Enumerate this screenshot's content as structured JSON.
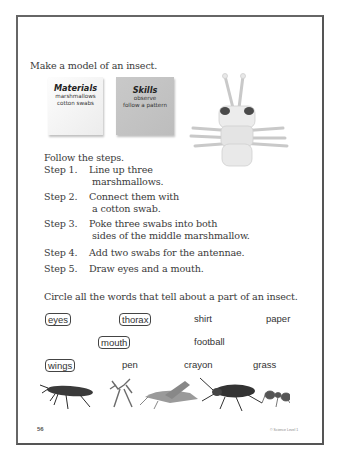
{
  "instructions": {
    "title": "Make a model of an insect.",
    "follow": "Follow the steps."
  },
  "materials_card": {
    "heading": "Materials",
    "items": [
      "marshmallows",
      "cotton swabs"
    ]
  },
  "skills_card": {
    "heading": "Skills",
    "items": [
      "observe",
      "follow a pattern"
    ]
  },
  "steps": [
    {
      "label": "Step 1.",
      "lines": [
        "Line up three",
        "marshmallows."
      ]
    },
    {
      "label": "Step 2.",
      "lines": [
        "Connect them with",
        "a cotton swab."
      ]
    },
    {
      "label": "Step 3.",
      "lines": [
        "Poke three swabs into both",
        "sides of the middle marshmallow."
      ]
    },
    {
      "label": "Step 4.",
      "lines": [
        "Add two swabs for the antennae."
      ]
    },
    {
      "label": "Step 5.",
      "lines": [
        "Draw eyes and a mouth."
      ]
    }
  ],
  "activity": {
    "prompt": "Circle all the words that tell about a part of an insect.",
    "words": [
      {
        "text": "eyes",
        "circled": true
      },
      {
        "text": "thorax",
        "circled": true
      },
      {
        "text": "shirt",
        "circled": false
      },
      {
        "text": "paper",
        "circled": false
      },
      {
        "text": "mouth",
        "circled": true
      },
      {
        "text": "football",
        "circled": false
      },
      {
        "text": "wings",
        "circled": true
      },
      {
        "text": "pen",
        "circled": false
      },
      {
        "text": "crayon",
        "circled": false
      },
      {
        "text": "grass",
        "circled": false
      }
    ]
  },
  "images": {
    "model": "marshmallow-insect-model",
    "insects": [
      "beetle-bug",
      "praying-mantis",
      "grasshopper",
      "ground-beetle",
      "ant"
    ]
  },
  "footer": {
    "page_number": "56",
    "credit": "© Science Level 1"
  }
}
